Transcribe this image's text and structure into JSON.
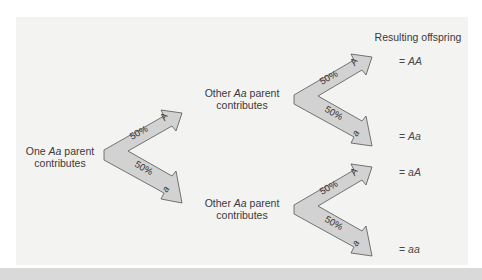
{
  "diagram": {
    "title": "Resulting offspring",
    "parent_one": {
      "prefix": "One ",
      "genotype": "Aa",
      "suffix": " parent",
      "line2": "contributes"
    },
    "parent_other_top": {
      "prefix": "Other ",
      "genotype": "Aa",
      "suffix": " parent",
      "line2": "contributes"
    },
    "parent_other_bottom": {
      "prefix": "Other ",
      "genotype": "Aa",
      "suffix": " parent",
      "line2": "contributes"
    },
    "branches": [
      {
        "id": "chevron-1",
        "upper": {
          "percent": "50%",
          "allele": "A"
        },
        "lower": {
          "percent": "50%",
          "allele": "a"
        }
      },
      {
        "id": "chevron-2",
        "upper": {
          "percent": "50%",
          "allele": "A"
        },
        "lower": {
          "percent": "50%",
          "allele": "a"
        }
      },
      {
        "id": "chevron-3",
        "upper": {
          "percent": "50%",
          "allele": "A"
        },
        "lower": {
          "percent": "50%",
          "allele": "a"
        }
      }
    ],
    "offspring": [
      {
        "eq": "= ",
        "genotype": "AA"
      },
      {
        "eq": "= ",
        "genotype": "Aa"
      },
      {
        "eq": "= ",
        "genotype": "aA"
      },
      {
        "eq": "= ",
        "genotype": "aa"
      }
    ],
    "colors": {
      "panel_bg": "#f3f3f2",
      "arrow_fill": "#d2d2d2",
      "arrow_stroke": "#555555",
      "text": "#3a3a3a"
    }
  }
}
